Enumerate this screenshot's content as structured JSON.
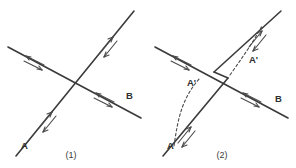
{
  "figure": {
    "background_color": "#ffffff",
    "line_color": "#3a3a3a",
    "dash_color": "#4a4a4a",
    "text_color": "#2e2e2e"
  },
  "panels": [
    {
      "id": "panel-1",
      "caption": "(1)",
      "description": "Two straight lines crossing at a single point, each bearing double-arrow direction marks.",
      "labels": [
        {
          "name": "label-a",
          "text": "A",
          "x": 21,
          "y": 149
        },
        {
          "name": "label-b",
          "text": "B",
          "x": 126,
          "y": 99
        }
      ],
      "lines": [
        {
          "name": "line-a-ascending",
          "x1": 16,
          "y1": 156,
          "x2": 134,
          "y2": 11,
          "markers": [
            {
              "name": "arrow-mark-lower",
              "t": 0.26
            },
            {
              "name": "arrow-mark-upper",
              "t": 0.74
            }
          ]
        },
        {
          "name": "line-b-descending",
          "x1": 8,
          "y1": 47,
          "x2": 141,
          "y2": 118,
          "markers": [
            {
              "name": "arrow-mark-left",
              "t": 0.22
            },
            {
              "name": "arrow-mark-right",
              "t": 0.76
            }
          ]
        }
      ]
    },
    {
      "id": "panel-2",
      "caption": "(2)",
      "description": "The same crossing, but the ascending line is split into two parallel offset segments forming a narrow parallelogram at the crossing; dashed curves labelled A' join the displaced segments.",
      "labels": [
        {
          "name": "label-a",
          "text": "A",
          "x": 167,
          "y": 149
        },
        {
          "name": "label-b",
          "text": "B",
          "x": 275,
          "y": 102
        },
        {
          "name": "label-a-prime-left",
          "text": "A'",
          "x": 187,
          "y": 86
        },
        {
          "name": "label-a-prime-right",
          "text": "A'",
          "x": 249,
          "y": 63
        }
      ],
      "lines": [
        {
          "name": "line-a-lower-segment",
          "x1": 163,
          "y1": 156,
          "x2": 228,
          "y2": 78,
          "markers": [
            {
              "name": "arrow-mark-lower",
              "t": 0.28
            }
          ]
        },
        {
          "name": "line-a-upper-segment",
          "x1": 214,
          "y1": 72,
          "x2": 281,
          "y2": 11,
          "markers": [
            {
              "name": "arrow-mark-upper",
              "t": 0.72
            }
          ]
        },
        {
          "name": "line-b-descending",
          "x1": 155,
          "y1": 47,
          "x2": 288,
          "y2": 118,
          "markers": [
            {
              "name": "arrow-mark-left",
              "t": 0.22
            },
            {
              "name": "arrow-mark-right",
              "t": 0.76
            }
          ]
        }
      ],
      "dashed_curves": [
        {
          "name": "dashed-curve-left",
          "path": "M 174 146 C 178 118, 182 98, 200 78"
        },
        {
          "name": "dashed-curve-right",
          "path": "M 230 75 C 242 58, 252 44, 262 26"
        }
      ]
    }
  ],
  "captions": {
    "panel_1": "(1)",
    "panel_2": "(2)"
  }
}
